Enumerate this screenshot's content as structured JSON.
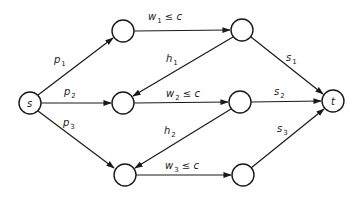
{
  "diagram": {
    "type": "flow-network",
    "stroke_color": "#1a1a1a",
    "background": "#ffffff",
    "nodes": [
      {
        "id": "s",
        "label": "s",
        "x": 30,
        "y": 103
      },
      {
        "id": "a1",
        "label": "",
        "x": 123,
        "y": 31
      },
      {
        "id": "a2",
        "label": "",
        "x": 123,
        "y": 103
      },
      {
        "id": "a3",
        "label": "",
        "x": 125,
        "y": 175
      },
      {
        "id": "b1",
        "label": "",
        "x": 242,
        "y": 30
      },
      {
        "id": "b2",
        "label": "",
        "x": 240,
        "y": 102
      },
      {
        "id": "b3",
        "label": "",
        "x": 243,
        "y": 175
      },
      {
        "id": "t",
        "label": "t",
        "x": 333,
        "y": 101
      }
    ],
    "edges": [
      {
        "from": "s",
        "to": "a1",
        "label": "p",
        "sub": "1"
      },
      {
        "from": "s",
        "to": "a2",
        "label": "p",
        "sub": "2"
      },
      {
        "from": "s",
        "to": "a3",
        "label": "p",
        "sub": "3"
      },
      {
        "from": "a1",
        "to": "b1",
        "label": "w",
        "sub": "1",
        "suffix": " ≤ c"
      },
      {
        "from": "a2",
        "to": "b2",
        "label": "w",
        "sub": "2",
        "suffix": " ≤ c"
      },
      {
        "from": "a3",
        "to": "b3",
        "label": "w",
        "sub": "3",
        "suffix": " ≤ c"
      },
      {
        "from": "b1",
        "to": "a2",
        "label": "h",
        "sub": "1"
      },
      {
        "from": "b2",
        "to": "a3",
        "label": "h",
        "sub": "2"
      },
      {
        "from": "b1",
        "to": "t",
        "label": "s",
        "sub": "1"
      },
      {
        "from": "b2",
        "to": "t",
        "label": "s",
        "sub": "2"
      },
      {
        "from": "b3",
        "to": "t",
        "label": "s",
        "sub": "3"
      }
    ],
    "labels": {
      "p1": {
        "main": "p",
        "sub": "1"
      },
      "p2": {
        "main": "p",
        "sub": "2"
      },
      "p3": {
        "main": "p",
        "sub": "3"
      },
      "w1": {
        "main": "w",
        "sub": "1",
        "rest": " ≤ c"
      },
      "w2": {
        "main": "w",
        "sub": "2",
        "rest": " ≤ c"
      },
      "w3": {
        "main": "w",
        "sub": "3",
        "rest": " ≤ c"
      },
      "h1": {
        "main": "h",
        "sub": "1"
      },
      "h2": {
        "main": "h",
        "sub": "2"
      },
      "s1": {
        "main": "s",
        "sub": "1"
      },
      "s2": {
        "main": "s",
        "sub": "2"
      },
      "s3": {
        "main": "s",
        "sub": "3"
      },
      "source": "s",
      "sink": "t"
    }
  }
}
